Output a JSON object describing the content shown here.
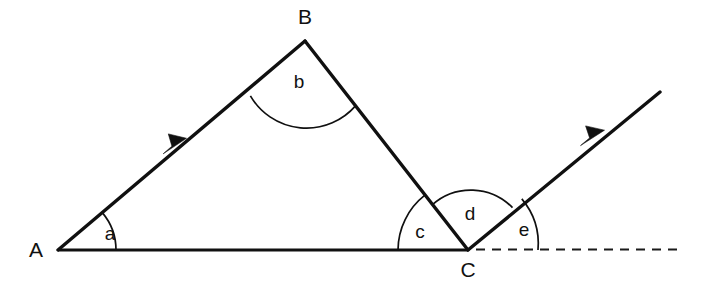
{
  "diagram": {
    "background_color": "#ffffff",
    "stroke_color": "#101010",
    "vertices": [
      {
        "name": "A",
        "label": "A",
        "x": 58,
        "y": 250,
        "label_x": 36,
        "label_y": 257
      },
      {
        "name": "B",
        "label": "B",
        "x": 305,
        "y": 41,
        "label_x": 305,
        "label_y": 24
      },
      {
        "name": "C",
        "label": "C",
        "x": 468,
        "y": 250,
        "label_x": 468,
        "label_y": 277
      }
    ],
    "angles": [
      {
        "name": "a",
        "label": "a",
        "vertex": "A",
        "radius": 58,
        "label_x": 110,
        "label_y": 240
      },
      {
        "name": "b",
        "label": "b",
        "vertex": "B",
        "radius": 65,
        "label_x": 299,
        "label_y": 88
      },
      {
        "name": "c",
        "label": "c",
        "vertex": "C",
        "radius": 70,
        "label_x": 420,
        "label_y": 238
      },
      {
        "name": "d",
        "label": "d",
        "vertex": "C",
        "radius": 58,
        "label_x": 470,
        "label_y": 220
      },
      {
        "name": "e",
        "label": "e",
        "vertex": "C",
        "radius": 70,
        "label_x": 524,
        "label_y": 236
      }
    ],
    "segments": [
      {
        "name": "side-ab",
        "from": "A",
        "to": "B",
        "style": "solid",
        "has_arrow": true
      },
      {
        "name": "side-bc",
        "from": "B",
        "to": "C",
        "style": "solid",
        "has_arrow": false
      },
      {
        "name": "side-ac",
        "from": "A",
        "to": "C",
        "style": "solid",
        "has_arrow": false
      },
      {
        "name": "ray-from-c",
        "from": "C",
        "to": "(660,92)",
        "style": "solid",
        "has_arrow": true
      },
      {
        "name": "extension-line",
        "from": "C",
        "to": "(681,249)",
        "style": "dashed",
        "has_arrow": false
      }
    ]
  }
}
